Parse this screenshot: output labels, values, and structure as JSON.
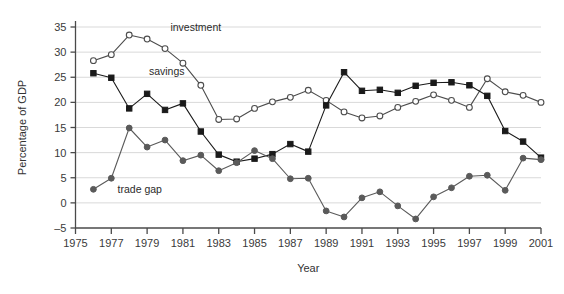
{
  "chart_data": {
    "type": "line",
    "title": "",
    "xlabel": "Year",
    "ylabel": "Percentage of GDP",
    "xlim": [
      1975,
      2001
    ],
    "ylim": [
      -5,
      35
    ],
    "ytick_step": 5,
    "xtick_step": 2,
    "grid": "horizontal",
    "legend_position": "inline-annotations",
    "xticks": [
      1975,
      1977,
      1979,
      1981,
      1983,
      1985,
      1987,
      1989,
      1991,
      1993,
      1995,
      1997,
      1999,
      2001
    ],
    "yticks": [
      -5,
      0,
      5,
      10,
      15,
      20,
      25,
      30,
      35
    ],
    "x": [
      1976,
      1977,
      1978,
      1979,
      1980,
      1981,
      1982,
      1983,
      1984,
      1985,
      1986,
      1987,
      1988,
      1989,
      1990,
      1991,
      1992,
      1993,
      1994,
      1995,
      1996,
      1997,
      1998,
      1999,
      2000,
      2001
    ],
    "series": [
      {
        "name": "investment",
        "marker": "open-circle",
        "color": "#4d4d4d",
        "values": [
          28.3,
          29.5,
          33.4,
          32.6,
          30.7,
          27.8,
          23.4,
          16.6,
          16.7,
          18.8,
          20.1,
          21.0,
          22.4,
          20.4,
          18.1,
          16.9,
          17.3,
          19.0,
          20.2,
          21.5,
          20.4,
          19.0,
          24.7,
          22.1,
          21.4,
          20.0
        ],
        "labels": {
          "text": "investment",
          "x": 1980.3,
          "y": 34.2
        }
      },
      {
        "name": "savings",
        "marker": "filled-square",
        "color": "#1a1a1a",
        "values": [
          25.8,
          24.9,
          18.8,
          21.7,
          18.5,
          19.8,
          14.2,
          9.6,
          8.2,
          8.8,
          9.7,
          11.7,
          10.2,
          19.4,
          26.0,
          22.3,
          22.5,
          21.9,
          23.3,
          23.9,
          24.0,
          23.4,
          21.3,
          14.3,
          12.2,
          9.0
        ],
        "labels": {
          "text": "savings",
          "x": 1979.1,
          "y": 25.5
        }
      },
      {
        "name": "trade gap",
        "marker": "filled-circle",
        "color": "#5a5a5a",
        "values": [
          2.7,
          4.9,
          14.9,
          11.1,
          12.5,
          8.4,
          9.5,
          6.4,
          8.0,
          10.4,
          8.8,
          4.8,
          4.9,
          -1.6,
          -2.8,
          1.0,
          2.2,
          -0.6,
          -3.2,
          1.2,
          3.0,
          5.3,
          5.5,
          2.5,
          8.9,
          8.6
        ]
      }
    ],
    "series_values_note": "trade gap series is plotted on the same percentage-of-GDP axis"
  },
  "annotations": {
    "investment_label": "investment",
    "savings_label": "savings",
    "tradegap_label": "trade gap"
  }
}
